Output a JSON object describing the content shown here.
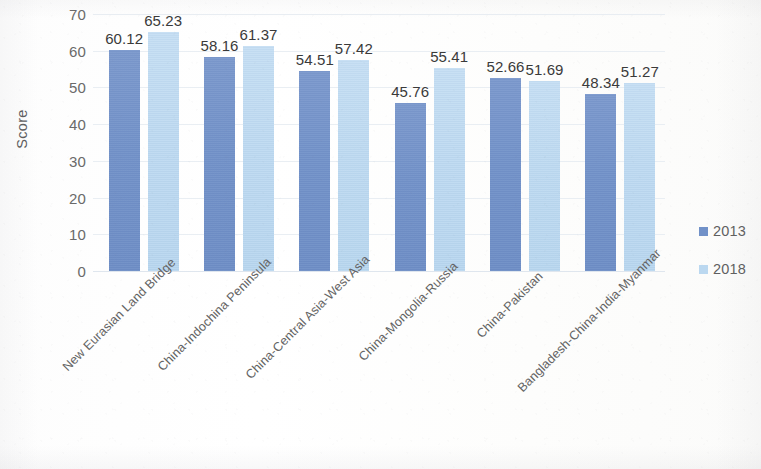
{
  "chart_data": {
    "type": "bar",
    "title": "",
    "subtitle": "",
    "xlabel": "",
    "ylabel": "Score",
    "ylim": [
      0,
      70
    ],
    "ytick_step": 10,
    "yticks": [
      "70",
      "60",
      "50",
      "40",
      "30",
      "20",
      "10",
      "0"
    ],
    "grid": true,
    "grid_axis": "y",
    "legend_position": "right",
    "categories": [
      "New Eurasian Land Bridge",
      "China-Indochina Peninsula",
      "China-Central Asia-West Asia",
      "China-Mongolia-Russia",
      "China-Pakistan",
      "Bangladesh-China-India-Myanmar"
    ],
    "series": [
      {
        "name": "2013",
        "color": "#7191c8",
        "values": [
          60.12,
          58.16,
          54.51,
          45.76,
          52.66,
          48.34
        ],
        "labels": [
          "60.12",
          "58.16",
          "54.51",
          "45.76",
          "52.66",
          "48.34"
        ]
      },
      {
        "name": "2018",
        "color": "#bbd8f0",
        "values": [
          65.23,
          61.37,
          57.42,
          55.41,
          51.69,
          51.27
        ],
        "labels": [
          "65.23",
          "61.37",
          "57.42",
          "55.41",
          "51.69",
          "51.27"
        ]
      }
    ]
  },
  "legend": {
    "items": [
      {
        "label": "2013",
        "color": "#7191c8"
      },
      {
        "label": "2018",
        "color": "#bbd8f0"
      }
    ]
  },
  "axis": {
    "y_title": "Score"
  },
  "colors": {
    "series_2013": "#7191c8",
    "series_2018": "#bbd8f0",
    "gridline": "#e9eef3",
    "tick_text": "#6a6a6a",
    "label_text": "#3a3a3a",
    "category_text": "#636363",
    "background": "#ffffff"
  }
}
